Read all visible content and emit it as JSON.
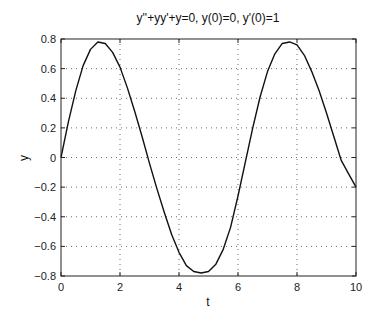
{
  "chart_data": {
    "type": "line",
    "title": "y''+yy'+y=0, y(0)=0, y'(0)=1",
    "xlabel": "t",
    "ylabel": "y",
    "xlim": [
      0,
      10
    ],
    "ylim": [
      -0.8,
      0.8
    ],
    "xticks": [
      0,
      2,
      4,
      6,
      8,
      10
    ],
    "yticks": [
      -0.8,
      -0.6,
      -0.4,
      -0.2,
      0,
      0.2,
      0.4,
      0.6,
      0.8
    ],
    "xtick_labels": [
      "0",
      "2",
      "4",
      "6",
      "8",
      "10"
    ],
    "ytick_labels": [
      "−0.8",
      "−0.6",
      "−0.4",
      "−0.2",
      "0",
      "0.2",
      "0.4",
      "0.6",
      "0.8"
    ],
    "grid": true,
    "legend": null,
    "series": [
      {
        "name": "y(t)",
        "color": "#111111",
        "x": [
          0,
          0.25,
          0.5,
          0.75,
          1.0,
          1.25,
          1.5,
          1.75,
          2.0,
          2.25,
          2.5,
          2.75,
          3.0,
          3.25,
          3.5,
          3.75,
          4.0,
          4.25,
          4.5,
          4.75,
          5.0,
          5.25,
          5.5,
          5.75,
          6.0,
          6.25,
          6.5,
          6.75,
          7.0,
          7.25,
          7.5,
          7.75,
          8.0,
          8.25,
          8.5,
          8.75,
          9.0,
          9.25,
          9.5,
          9.75,
          10.0
        ],
        "y": [
          0,
          0.24,
          0.45,
          0.62,
          0.73,
          0.78,
          0.77,
          0.71,
          0.61,
          0.47,
          0.31,
          0.14,
          -0.04,
          -0.21,
          -0.37,
          -0.52,
          -0.64,
          -0.73,
          -0.77,
          -0.78,
          -0.77,
          -0.72,
          -0.62,
          -0.47,
          -0.26,
          -0.03,
          0.2,
          0.41,
          0.58,
          0.7,
          0.77,
          0.78,
          0.76,
          0.69,
          0.58,
          0.45,
          0.3,
          0.14,
          -0.02,
          -0.11,
          -0.2
        ]
      }
    ]
  }
}
